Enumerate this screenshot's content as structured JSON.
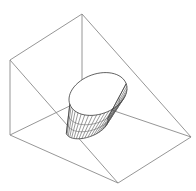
{
  "figure": {
    "colors": {
      "background": "#ffffff",
      "box_edges": "#8a8a8a",
      "cone_rim": "#3a3a3a",
      "cone_rulings": "#555555"
    },
    "top_fragment_text": "",
    "wedge": {
      "vertices": {
        "top": [
          82,
          14
        ],
        "left_top": [
          10,
          60
        ],
        "left_bottom": [
          10,
          135
        ],
        "bottom": [
          118,
          183
        ],
        "right": [
          191,
          137
        ],
        "back_hidden": [
          82,
          100
        ]
      },
      "edges": [
        [
          "top",
          "left_top"
        ],
        [
          "top",
          "right"
        ],
        [
          "left_top",
          "left_bottom"
        ],
        [
          "left_bottom",
          "bottom"
        ],
        [
          "bottom",
          "right"
        ],
        [
          "left_top",
          "bottom"
        ],
        [
          "top",
          "back_hidden"
        ],
        [
          "left_bottom",
          "back_hidden"
        ],
        [
          "back_hidden",
          "right"
        ]
      ]
    },
    "cone": {
      "top_rim_center": [
        98,
        94
      ],
      "top_rim_rx": 30,
      "top_rim_ry": 20,
      "bottom_rim_center": [
        87,
        126
      ],
      "bottom_rim_rx": 22,
      "bottom_rim_ry": 11,
      "ruling_count": 22
    }
  }
}
